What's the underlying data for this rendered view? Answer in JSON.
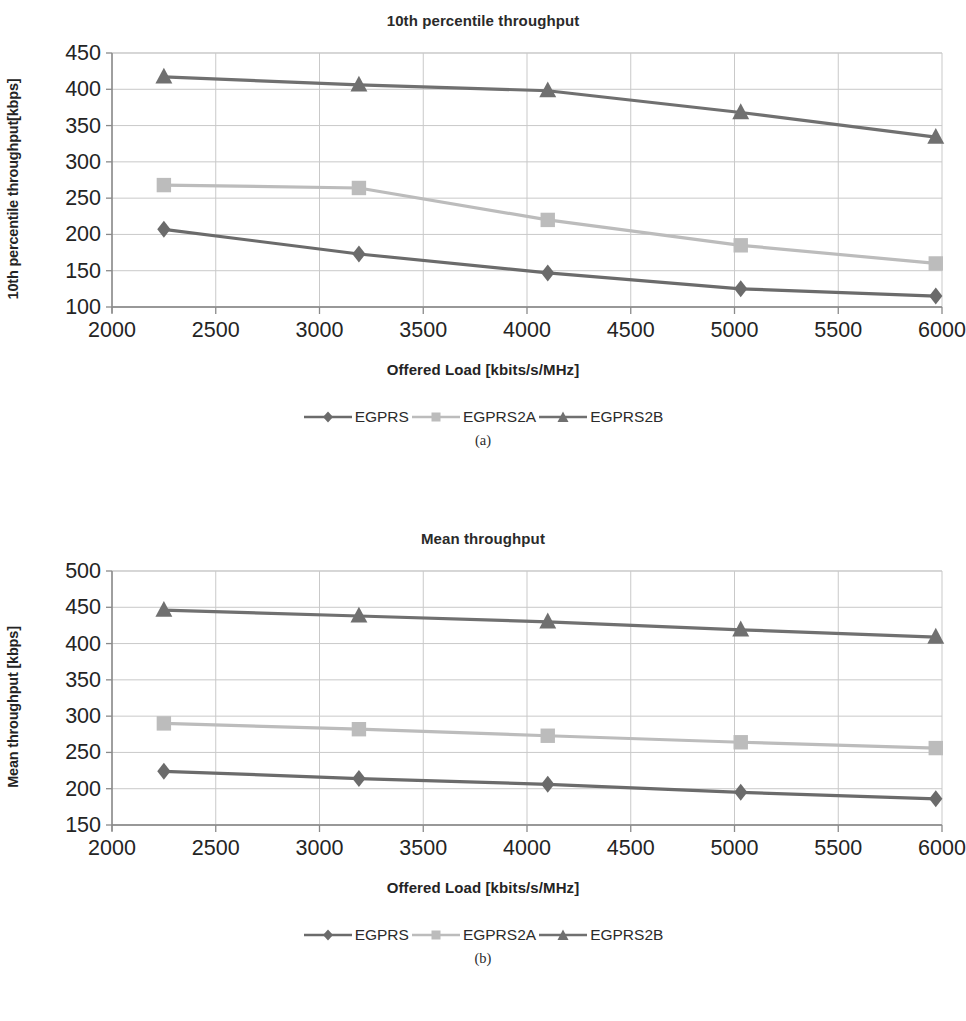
{
  "figure": {
    "panels": [
      {
        "id": "a",
        "subcaption": "(a)",
        "title": "10th percentile throughput",
        "xlabel": "Offered Load [kbits/s/MHz]",
        "ylabel": "10th percentile throughput[kbps]",
        "legend": [
          "EGPRS",
          "EGPRS2A",
          "EGPRS2B"
        ]
      },
      {
        "id": "b",
        "subcaption": "(b)",
        "title": "Mean throughput",
        "xlabel": "Offered Load [kbits/s/MHz]",
        "ylabel": "Mean throughput [kbps]",
        "legend": [
          "EGPRS",
          "EGPRS2A",
          "EGPRS2B"
        ]
      }
    ]
  },
  "colors": {
    "egprs": "#6b6b6b",
    "egprs2a": "#bcbcbc",
    "egprs2b": "#707070",
    "axis": "#8a8a8a",
    "grid": "#c9c9c9",
    "text": "#242424"
  },
  "chart_data": [
    {
      "type": "line",
      "title": "10th percentile throughput",
      "xlabel": "Offered Load [kbits/s/MHz]",
      "ylabel": "10th percentile throughput[kbps]",
      "xlim": [
        2000,
        6000
      ],
      "ylim": [
        100,
        450
      ],
      "xticks": [
        2000,
        2500,
        3000,
        3500,
        4000,
        4500,
        5000,
        5500,
        6000
      ],
      "yticks": [
        100,
        150,
        200,
        250,
        300,
        350,
        400,
        450
      ],
      "grid": true,
      "legend_position": "bottom",
      "x": [
        2250,
        3190,
        4100,
        5030,
        5970
      ],
      "series": [
        {
          "name": "EGPRS",
          "marker": "diamond",
          "values": [
            207,
            173,
            147,
            125,
            115
          ]
        },
        {
          "name": "EGPRS2A",
          "marker": "square",
          "values": [
            268,
            264,
            220,
            185,
            160
          ]
        },
        {
          "name": "EGPRS2B",
          "marker": "triangle",
          "values": [
            417,
            406,
            398,
            368,
            334
          ]
        }
      ]
    },
    {
      "type": "line",
      "title": "Mean throughput",
      "xlabel": "Offered Load [kbits/s/MHz]",
      "ylabel": "Mean throughput [kbps]",
      "xlim": [
        2000,
        6000
      ],
      "ylim": [
        150,
        500
      ],
      "xticks": [
        2000,
        2500,
        3000,
        3500,
        4000,
        4500,
        5000,
        5500,
        6000
      ],
      "yticks": [
        150,
        200,
        250,
        300,
        350,
        400,
        450,
        500
      ],
      "grid": true,
      "legend_position": "bottom",
      "x": [
        2250,
        3190,
        4100,
        5030,
        5970
      ],
      "series": [
        {
          "name": "EGPRS",
          "marker": "diamond",
          "values": [
            224,
            214,
            206,
            195,
            186
          ]
        },
        {
          "name": "EGPRS2A",
          "marker": "square",
          "values": [
            290,
            282,
            273,
            264,
            256
          ]
        },
        {
          "name": "EGPRS2B",
          "marker": "triangle",
          "values": [
            446,
            438,
            430,
            419,
            409
          ]
        }
      ]
    }
  ]
}
